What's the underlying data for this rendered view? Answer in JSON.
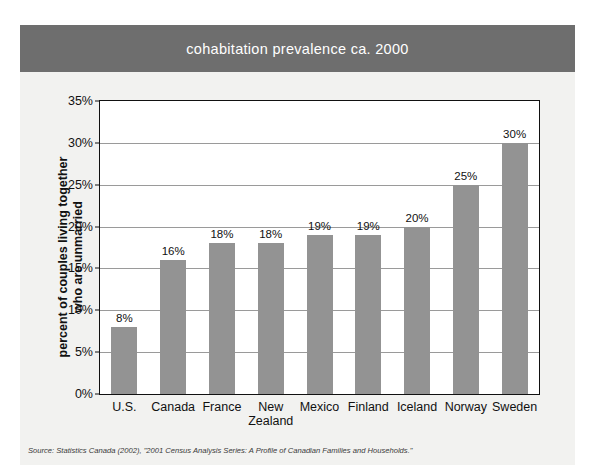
{
  "title": "cohabitation prevalence ca. 2000",
  "source_note": "Source: Statistics Canada (2002), \"2001 Census Analysis Series: A Profile of Canadian Families and Households.\"",
  "colors": {
    "title_band": "#6e6e6e",
    "title_text": "#ffffff",
    "bar": "#939393",
    "card_background": "#f2f2f0",
    "plot_background": "#ffffff",
    "axis": "#111111",
    "gridline": "#9a9a9a"
  },
  "chart_data": {
    "type": "bar",
    "title": "cohabitation prevalence ca. 2000",
    "xlabel": "",
    "ylabel": "percent of couples living together who are unmarried",
    "ylabel_lines": [
      "percent of couples living together",
      "who are unmarried"
    ],
    "categories": [
      "U.S.",
      "Canada",
      "France",
      "New Zealand",
      "Mexico",
      "Finland",
      "Iceland",
      "Norway",
      "Sweden"
    ],
    "category_display": [
      "U.S.",
      "Canada",
      "France",
      "New\nZealand",
      "Mexico",
      "Finland",
      "Iceland",
      "Norway",
      "Sweden"
    ],
    "values": [
      8,
      16,
      18,
      18,
      19,
      19,
      20,
      25,
      30
    ],
    "value_labels": [
      "8%",
      "16%",
      "18%",
      "18%",
      "19%",
      "19%",
      "20%",
      "25%",
      "30%"
    ],
    "ylim": [
      0,
      35
    ],
    "ytick_values": [
      0,
      5,
      10,
      15,
      20,
      25,
      30,
      35
    ],
    "ytick_labels": [
      "0%",
      "5%",
      "10%",
      "15%",
      "20%",
      "25%",
      "30%",
      "35%"
    ],
    "grid": true,
    "legend": "none",
    "series_name": "cohabitation prevalence"
  }
}
